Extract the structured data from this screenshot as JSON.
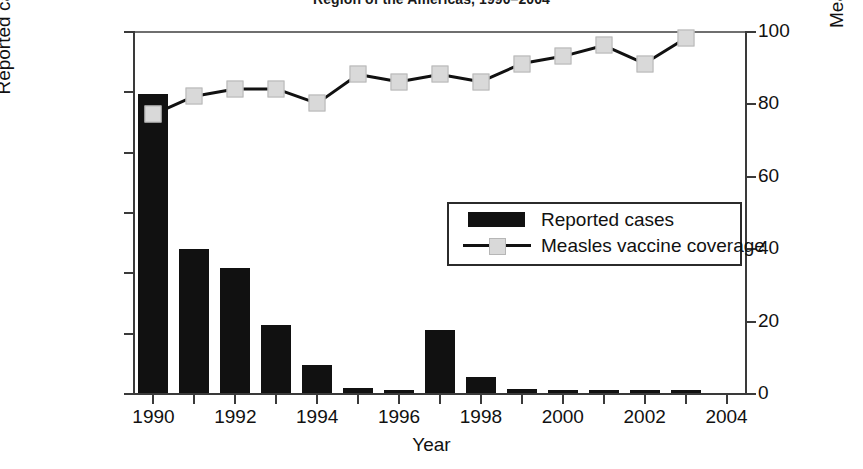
{
  "chart_title": "Region of the Americas, 1990–2004",
  "axes": {
    "left_title": "Reported cases",
    "right_title": "Measles vaccine coverage",
    "x_title": "Year",
    "left_ticks": [
      "300,000",
      "250,000",
      "200,000",
      "150,000",
      "100,000",
      "50,000",
      "0"
    ],
    "right_ticks": [
      "100",
      "80",
      "60",
      "40",
      "20",
      "0"
    ],
    "x_ticks": [
      "1990",
      "1992",
      "1994",
      "1996",
      "1998",
      "2000",
      "2002",
      "2004"
    ]
  },
  "legend": {
    "position": "inside-right",
    "entries": [
      {
        "label": "Reported cases",
        "marker": "black-bar-swatch",
        "color": "#111111"
      },
      {
        "label": "Measles vaccine coverage",
        "marker": "line-with-square-marker",
        "color": "#111111"
      }
    ]
  },
  "chart_data": {
    "type": "bar",
    "title": "Region of the Americas, 1990–2004",
    "xlabel": "Year",
    "ylabel": "Reported cases",
    "y2label": "Measles vaccine coverage",
    "grid": false,
    "legend_position": "inside-right",
    "xlim": [
      1989.5,
      2004.5
    ],
    "ylim": [
      0,
      300000
    ],
    "y2lim": [
      0,
      100
    ],
    "categories": [
      1990,
      1991,
      1992,
      1993,
      1994,
      1995,
      1996,
      1997,
      1998,
      1999,
      2000,
      2001,
      2002,
      2003,
      2004
    ],
    "series": [
      {
        "name": "Reported cases",
        "type": "bar",
        "axis": "left",
        "color": "#111111",
        "values": [
          248000,
          119000,
          104000,
          56000,
          23000,
          4000,
          1300,
          52000,
          13500,
          3000,
          1100,
          400,
          1000,
          200,
          null
        ]
      },
      {
        "name": "Measles vaccine coverage",
        "type": "line",
        "axis": "right",
        "color": "#111111",
        "marker_color": "#d9d9d9",
        "values": [
          77,
          82,
          84,
          84,
          80,
          88,
          86,
          88,
          86,
          91,
          93,
          96,
          91,
          98,
          null
        ]
      }
    ]
  }
}
